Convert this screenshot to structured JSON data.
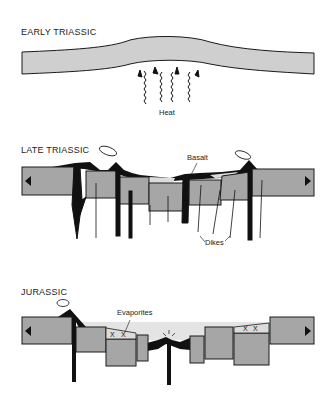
{
  "panels": [
    {
      "id": "early",
      "title": "EARLY TRIASSIC",
      "labels": {
        "heat": "Heat"
      }
    },
    {
      "id": "late",
      "title": "LATE TRIASSIC",
      "labels": {
        "basalt": "Basalt",
        "dikes": "Dikes"
      }
    },
    {
      "id": "jurassic",
      "title": "JURASSIC",
      "labels": {
        "evaporites": "Evaporites"
      }
    }
  ],
  "colors": {
    "crust": "#a6a6a6",
    "crust_light": "#cfcfcf",
    "basalt": "#111111",
    "sediment": "#dcdcdc",
    "outline": "#1a1a1a"
  }
}
